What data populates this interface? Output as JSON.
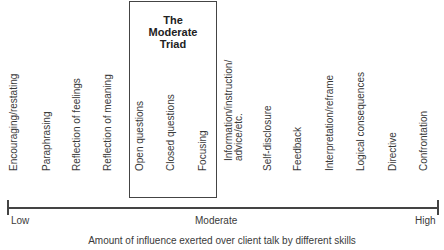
{
  "triad": {
    "title_lines": [
      "The",
      "Moderate",
      "Triad"
    ]
  },
  "skills": [
    {
      "label": "Encouraging/restating",
      "x": 14
    },
    {
      "label": "Paraphrasing",
      "x": 47
    },
    {
      "label": "Reflection of feelings",
      "x": 77
    },
    {
      "label": "Reflection of meaning",
      "x": 108
    },
    {
      "label": "Open questions",
      "x": 140
    },
    {
      "label": "Closed questions",
      "x": 171
    },
    {
      "label": "Focusing",
      "x": 203
    },
    {
      "label_lines": [
        "Information/instruction/",
        "advice/etc."
      ],
      "x": 233
    },
    {
      "label": "Self-disclosure",
      "x": 268
    },
    {
      "label": "Feedback",
      "x": 298
    },
    {
      "label": "Interpretation/reframe",
      "x": 330
    },
    {
      "label": "Logical consequences",
      "x": 361
    },
    {
      "label": "Directive",
      "x": 393
    },
    {
      "label": "Confrontation",
      "x": 424
    }
  ],
  "axis": {
    "low": "Low",
    "moderate": "Moderate",
    "high": "High",
    "caption": "Amount of influence exerted over client talk by different skills"
  }
}
